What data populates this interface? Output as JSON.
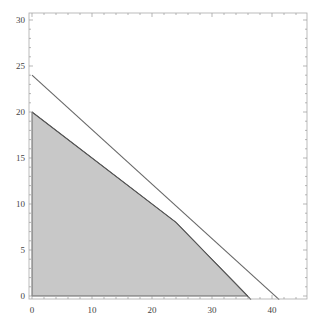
{
  "chart_data": {
    "type": "area",
    "title": "",
    "xlabel": "",
    "ylabel": "",
    "xlim": [
      0,
      45.8
    ],
    "ylim": [
      0,
      30.8
    ],
    "grid": false,
    "legend": null,
    "x_ticks": [
      0,
      10,
      20,
      30,
      40
    ],
    "y_ticks": [
      0,
      5,
      10,
      15,
      20,
      25,
      30
    ],
    "x_tick_labels": [
      "0",
      "10",
      "20",
      "30",
      "40"
    ],
    "y_tick_labels": [
      "0",
      "5",
      "10",
      "15",
      "20",
      "25",
      "30"
    ],
    "feasible_region": {
      "vertices": [
        [
          0,
          0
        ],
        [
          0,
          20
        ],
        [
          24,
          8
        ],
        [
          36,
          0
        ]
      ],
      "fill": "#c8c8c8",
      "edge": "#666666"
    },
    "lines": [
      {
        "name": "constraint-1",
        "points": [
          [
            0,
            20
          ],
          [
            24,
            8
          ],
          [
            36.5,
            -0.4
          ]
        ],
        "color": "#555555"
      },
      {
        "name": "constraint-2",
        "points": [
          [
            0,
            24
          ],
          [
            41.2,
            -0.4
          ]
        ],
        "color": "#666666"
      }
    ]
  },
  "colors": {
    "frame": "#aaaaaa",
    "fill": "#c8c8c8",
    "line": "#5a5a5a"
  }
}
